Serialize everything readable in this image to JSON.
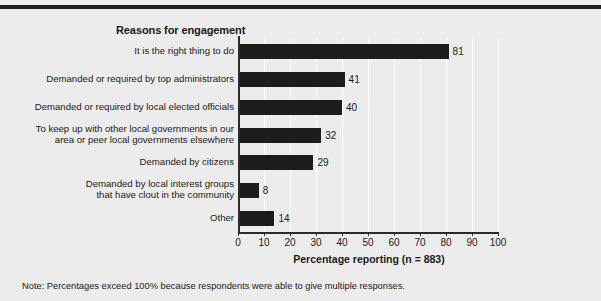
{
  "chart_data": {
    "type": "bar",
    "orientation": "horizontal",
    "title": "Reasons for engagement",
    "xlabel": "Percentage reporting (n = 883)",
    "ylabel": "",
    "xlim": [
      0,
      100
    ],
    "xticks": [
      0,
      10,
      20,
      30,
      40,
      50,
      60,
      70,
      80,
      90,
      100
    ],
    "grid": true,
    "legend": null,
    "bar_color": "#1c1c1c",
    "background_color": "#ececec",
    "categories": [
      "It is the right thing to do",
      "Demanded or required by top administrators",
      "Demanded or required by local elected officials",
      "To keep up with other local governments in our\narea or peer local governments elsewhere",
      "Demanded by citizens",
      "Demanded by local interest groups\nthat have clout in the community",
      "Other"
    ],
    "values": [
      81,
      41,
      40,
      32,
      29,
      8,
      14
    ],
    "value_labels": [
      "81",
      "41",
      "40",
      "32",
      "29",
      "8",
      "14"
    ],
    "annotation": "Note: Percentages exceed 100% because respondents were able to give multiple responses."
  }
}
